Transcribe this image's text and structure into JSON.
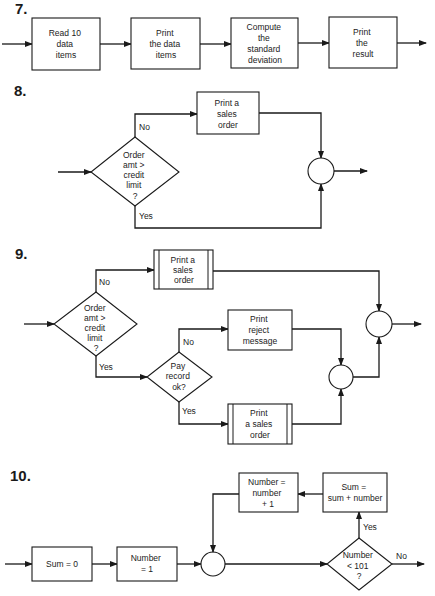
{
  "diagrams": [
    {
      "number": "7.",
      "type": "sequence",
      "boxes": [
        {
          "lines": [
            "Read 10",
            "data",
            "items"
          ]
        },
        {
          "lines": [
            "Print",
            "the data",
            "items"
          ]
        },
        {
          "lines": [
            "Compute",
            "the",
            "standard",
            "deviation"
          ]
        },
        {
          "lines": [
            "Print",
            "the",
            "result"
          ]
        }
      ]
    },
    {
      "number": "8.",
      "type": "selection",
      "decision": {
        "lines": [
          "Order",
          "amt >",
          "credit",
          "limit",
          "?"
        ]
      },
      "no_label": "No",
      "yes_label": "Yes",
      "no_box": {
        "lines": [
          "Print a",
          "sales",
          "order"
        ]
      }
    },
    {
      "number": "9.",
      "type": "nested-selection",
      "decision1": {
        "lines": [
          "Order",
          "amt >",
          "credit",
          "limit",
          "?"
        ]
      },
      "no_label1": "No",
      "yes_label1": "Yes",
      "no_box1": {
        "lines": [
          "Print a",
          "sales",
          "order"
        ]
      },
      "decision2": {
        "lines": [
          "Pay",
          "record",
          "ok?"
        ]
      },
      "no_label2": "No",
      "yes_label2": "Yes",
      "no_box2": {
        "lines": [
          "Print",
          "reject",
          "message"
        ]
      },
      "yes_box2": {
        "lines": [
          "Print",
          "a sales",
          "order"
        ]
      }
    },
    {
      "number": "10.",
      "type": "loop",
      "init1": {
        "lines": [
          "Sum = 0"
        ]
      },
      "init2": {
        "lines": [
          "Number",
          "= 1"
        ]
      },
      "decision": {
        "lines": [
          "Number",
          "< 101",
          "?"
        ]
      },
      "yes_label": "Yes",
      "no_label": "No",
      "body1": {
        "lines": [
          "Sum =",
          "sum + number"
        ]
      },
      "body2": {
        "lines": [
          "Number =",
          "number",
          "+ 1"
        ]
      }
    }
  ]
}
